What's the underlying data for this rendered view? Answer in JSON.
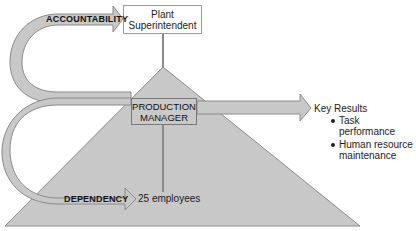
{
  "diagram": {
    "type": "organizational-accountability-dependency",
    "nodes": {
      "superior": {
        "label_line1": "Plant",
        "label_line2": "Superintendent"
      },
      "manager": {
        "label_line1": "PRODUCTION",
        "label_line2": "MANAGER"
      },
      "subordinates": {
        "label": "25 employees"
      }
    },
    "arrows": {
      "accountability": {
        "label": "ACCOUNTABILITY"
      },
      "dependency": {
        "label": "DEPENDENCY"
      }
    },
    "key_results": {
      "title": "Key Results",
      "items": [
        {
          "line1": "Task performance",
          "line2": ""
        },
        {
          "line1": "Human resource",
          "line2": "maintenance"
        }
      ]
    },
    "colors": {
      "shape_fill": "#c8c8c8",
      "shape_stroke": "#8a8a8a",
      "connector": "#8a8a8a",
      "box_border": "#9a9a9a",
      "text": "#1a1a1a"
    }
  }
}
